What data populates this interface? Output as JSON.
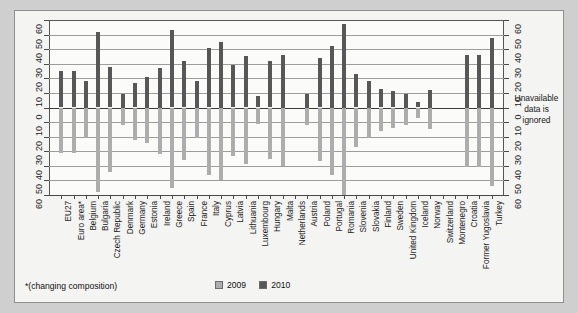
{
  "figure": {
    "annotation": "Unavailable data is ignored",
    "footnote": "*(changing composition)",
    "background_color": "#f4f4f2",
    "plot_background_color": "#fbfbfa"
  },
  "legend": {
    "position": "bottom-center",
    "items": [
      {
        "label": "2009",
        "color": "#adadad"
      },
      {
        "label": "2010",
        "color": "#575757"
      }
    ]
  },
  "chart_data": {
    "type": "bar",
    "orientation": "vertical-mirrored",
    "title": "",
    "subtitle": "",
    "xlabel": "",
    "ylabel": "",
    "grid": true,
    "axis_top": {
      "ylim": [
        0,
        60
      ],
      "ticks": [
        0,
        10,
        20,
        30,
        40,
        50,
        60
      ],
      "tick_labels": [
        "0",
        "10",
        "20",
        "30",
        "40",
        "50",
        "60"
      ]
    },
    "axis_bottom": {
      "ylim": [
        0,
        60
      ],
      "ticks": [
        0,
        10,
        20,
        30,
        40,
        50,
        60
      ],
      "tick_labels": [
        "0",
        "10",
        "20",
        "30",
        "40",
        "50",
        "60"
      ]
    },
    "y_tick_labels_top_to_bottom": [
      "60",
      "50",
      "40",
      "30",
      "20",
      "10",
      "0",
      "10",
      "20",
      "30",
      "40",
      "50",
      "60"
    ],
    "categories": [
      "EU27",
      "Euro area*",
      "Belgium",
      "Bulgaria",
      "Czech Republic",
      "Denmark",
      "Germany",
      "Estonia",
      "Ireland",
      "Greece",
      "Spain",
      "France",
      "Italy",
      "Cyprus",
      "Latvia",
      "Lithuania",
      "Luxembourg",
      "Hungary",
      "Malta",
      "Netherlands",
      "Austria",
      "Poland",
      "Portugal",
      "Romania",
      "Slovenia",
      "Slovakia",
      "Finland",
      "Sweden",
      "United Kingdom",
      "Iceland",
      "Norway",
      "Switzerland",
      "Montenegro",
      "Croatia",
      "Former Yugoslavia",
      "Turkey"
    ],
    "series": [
      {
        "name": "2010",
        "color": "#575757",
        "direction": "up",
        "values": [
          25,
          25,
          18,
          52,
          28,
          9,
          17,
          21,
          27,
          53,
          32,
          18,
          41,
          45,
          29,
          35,
          8,
          32,
          36,
          0,
          9,
          34,
          42,
          57,
          23,
          18,
          13,
          11,
          9,
          4,
          12,
          null,
          null,
          36,
          36,
          48
        ]
      },
      {
        "name": "2009",
        "color": "#adadad",
        "direction": "down",
        "values": [
          31,
          31,
          21,
          58,
          44,
          12,
          22,
          24,
          32,
          55,
          36,
          21,
          46,
          50,
          33,
          39,
          11,
          35,
          40,
          0,
          12,
          37,
          46,
          60,
          27,
          21,
          16,
          14,
          12,
          7,
          15,
          null,
          null,
          41,
          41,
          54
        ]
      }
    ],
    "annotations": [
      "Unavailable data is ignored"
    ],
    "notes": [
      "*(changing composition)"
    ]
  }
}
